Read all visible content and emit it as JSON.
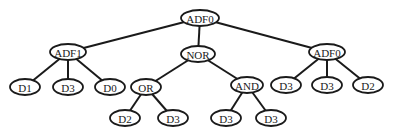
{
  "diagram": {
    "type": "tree",
    "nodes": [
      {
        "id": "n0",
        "label": "ADF0",
        "x": 200,
        "y": 18,
        "rx": 19
      },
      {
        "id": "n1",
        "label": "ADF1",
        "x": 68,
        "y": 52,
        "rx": 18
      },
      {
        "id": "n2",
        "label": "NOR",
        "x": 198,
        "y": 54,
        "rx": 17
      },
      {
        "id": "n3",
        "label": "ADF0",
        "x": 327,
        "y": 52,
        "rx": 18
      },
      {
        "id": "n4",
        "label": "D1",
        "x": 25,
        "y": 87,
        "rx": 15
      },
      {
        "id": "n5",
        "label": "D3",
        "x": 68,
        "y": 87,
        "rx": 15
      },
      {
        "id": "n6",
        "label": "D0",
        "x": 110,
        "y": 87,
        "rx": 15
      },
      {
        "id": "n7",
        "label": "OR",
        "x": 146,
        "y": 87,
        "rx": 15
      },
      {
        "id": "n8",
        "label": "AND",
        "x": 247,
        "y": 85,
        "rx": 16
      },
      {
        "id": "n9",
        "label": "D2",
        "x": 125,
        "y": 118,
        "rx": 15
      },
      {
        "id": "n10",
        "label": "D3",
        "x": 173,
        "y": 118,
        "rx": 15
      },
      {
        "id": "n11",
        "label": "D3",
        "x": 226,
        "y": 118,
        "rx": 15
      },
      {
        "id": "n12",
        "label": "D3",
        "x": 271,
        "y": 118,
        "rx": 15
      },
      {
        "id": "n13",
        "label": "D3",
        "x": 286,
        "y": 85,
        "rx": 15
      },
      {
        "id": "n14",
        "label": "D3",
        "x": 327,
        "y": 85,
        "rx": 15
      },
      {
        "id": "n15",
        "label": "D2",
        "x": 368,
        "y": 85,
        "rx": 15
      }
    ],
    "edges": [
      [
        "n0",
        "n1"
      ],
      [
        "n0",
        "n2"
      ],
      [
        "n0",
        "n3"
      ],
      [
        "n1",
        "n4"
      ],
      [
        "n1",
        "n5"
      ],
      [
        "n1",
        "n6"
      ],
      [
        "n2",
        "n7"
      ],
      [
        "n2",
        "n8"
      ],
      [
        "n7",
        "n9"
      ],
      [
        "n7",
        "n10"
      ],
      [
        "n8",
        "n11"
      ],
      [
        "n8",
        "n12"
      ],
      [
        "n3",
        "n13"
      ],
      [
        "n3",
        "n14"
      ],
      [
        "n3",
        "n15"
      ]
    ]
  }
}
